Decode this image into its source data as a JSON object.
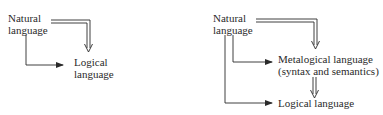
{
  "diagrams": [
    {
      "name": "two-language-scheme",
      "nodes": {
        "natural": [
          "Natural",
          "language"
        ],
        "logical": [
          "Logical",
          "language"
        ]
      },
      "edges": [
        {
          "from": "natural",
          "to": "logical",
          "style": "double-arrow"
        },
        {
          "from": "natural",
          "to": "logical",
          "style": "single-arrow"
        }
      ]
    },
    {
      "name": "three-language-scheme",
      "nodes": {
        "natural": [
          "Natural",
          "language"
        ],
        "metalogical": [
          "Metalogical language",
          "(syntax and semantics)"
        ],
        "logical": [
          "Logical language"
        ]
      },
      "edges": [
        {
          "from": "natural",
          "to": "metalogical",
          "style": "double-arrow"
        },
        {
          "from": "natural",
          "to": "metalogical",
          "style": "single-arrow"
        },
        {
          "from": "metalogical",
          "to": "logical",
          "style": "double-arrow"
        },
        {
          "from": "natural",
          "to": "logical",
          "style": "single-arrow"
        }
      ]
    }
  ],
  "colors": {
    "ink": "#2a2a2a",
    "background": "#ffffff"
  }
}
